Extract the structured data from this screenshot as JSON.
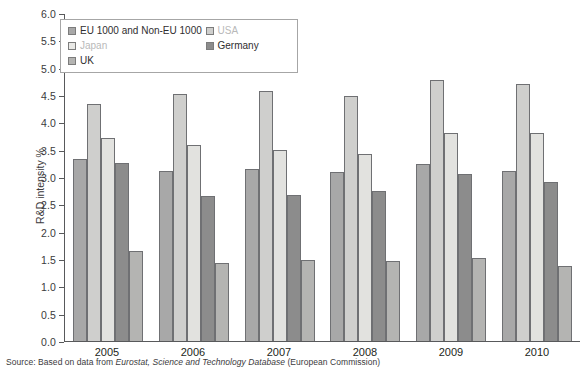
{
  "chart_data": {
    "type": "bar",
    "title": "",
    "xlabel": "",
    "ylabel": "R&D intensity %",
    "ylim": [
      0.0,
      6.0
    ],
    "ytick_step": 0.5,
    "grid": false,
    "legend_position": "top-left-inside",
    "categories": [
      "2005",
      "2006",
      "2007",
      "2008",
      "2009",
      "2010"
    ],
    "yticks": [
      "0.0",
      "0.5",
      "1.0",
      "1.5",
      "2.0",
      "2.5",
      "3.0",
      "3.5",
      "4.0",
      "4.5",
      "5.0",
      "5.5",
      "6.0"
    ],
    "series": [
      {
        "name": "EU 1000 and Non-EU 1000",
        "key": "eu",
        "color": "#a8a8a8",
        "values": [
          3.33,
          3.11,
          3.15,
          3.09,
          3.24,
          3.11
        ]
      },
      {
        "name": "USA",
        "key": "usa",
        "color": "#cfcfcd",
        "values": [
          4.33,
          4.51,
          4.57,
          4.48,
          4.78,
          4.71
        ]
      },
      {
        "name": "Japan",
        "key": "japan",
        "color": "#e2e2df",
        "values": [
          3.71,
          3.58,
          3.5,
          3.42,
          3.81,
          3.81
        ]
      },
      {
        "name": "Germany",
        "key": "germany",
        "color": "#8c8c8c",
        "values": [
          3.25,
          2.65,
          2.67,
          2.74,
          3.06,
          2.9
        ]
      },
      {
        "name": "UK",
        "key": "uk",
        "color": "#b4b4b2",
        "values": [
          1.65,
          1.43,
          1.49,
          1.46,
          1.51,
          1.37
        ]
      }
    ]
  },
  "legend": {
    "items": [
      {
        "label": "EU 1000 and Non-EU 1000",
        "swatch": "sw-eu",
        "faint": false
      },
      {
        "label": "Japan",
        "swatch": "sw-japan",
        "faint": true
      },
      {
        "label": "UK",
        "swatch": "sw-uk",
        "faint": false
      },
      {
        "label": "USA",
        "swatch": "sw-usa",
        "faint": true
      },
      {
        "label": "Germany",
        "swatch": "sw-germany",
        "faint": false
      }
    ]
  },
  "source": {
    "prefix": "Source: Based on data from ",
    "italic": "Eurostat, Science and Technology Database",
    "suffix": " (European Commission)"
  }
}
